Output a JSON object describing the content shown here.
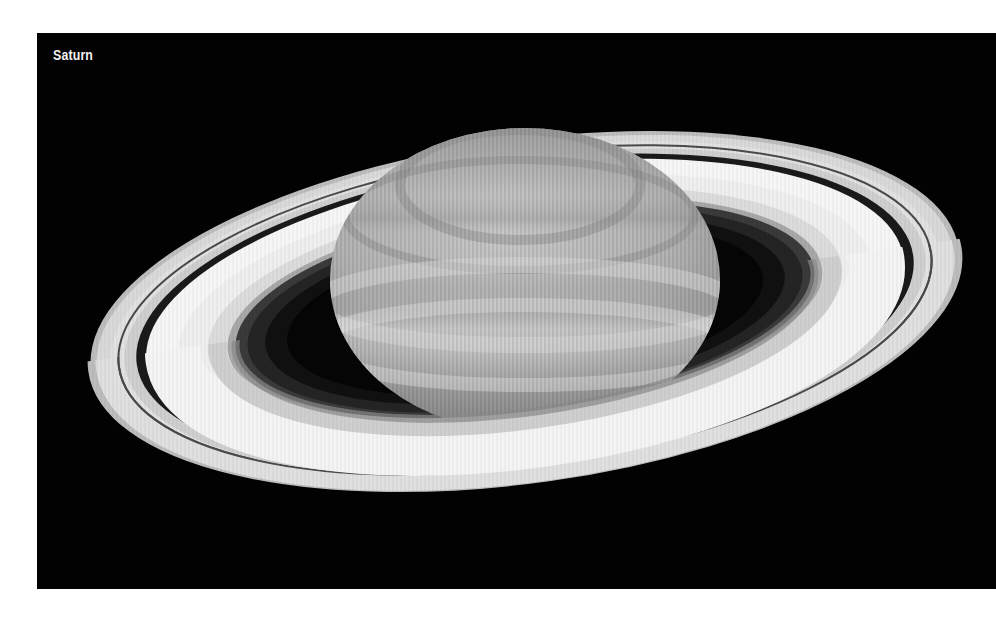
{
  "figure": {
    "caption": "Saturn",
    "colors": {
      "background": "#020202",
      "page": "#ffffff",
      "caption_text": "#f2f2f2",
      "ring_bright": "#f4f4f4",
      "planet": "#bdbdbd"
    }
  }
}
